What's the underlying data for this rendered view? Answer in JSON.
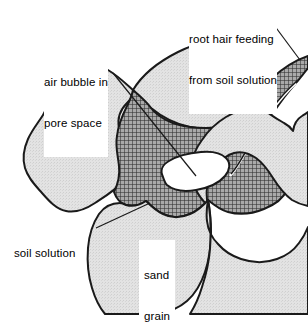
{
  "figure": {
    "background_color": "#ffffff",
    "width": 308,
    "height": 315
  },
  "colors": {
    "outline": "#1a1a1a",
    "sand_grain_fill": "#e2e2e2",
    "sand_grain_speckle": "#c9c9c9",
    "soil_solution_fill": "#8d8d8d",
    "soil_solution_hatch": "#2b2b2b",
    "air_bubble_fill": "#ffffff",
    "label_text": "#000000",
    "leader_line": "#1a1a1a"
  },
  "labels": {
    "root_hair": {
      "line1": "root hair feeding",
      "line2": "from soil solution"
    },
    "air_bubble": {
      "line1": "air bubble in",
      "line2": "pore space"
    },
    "soil_solution": {
      "line1": "soil solution"
    },
    "sand_grain": {
      "line1": "sand",
      "line2": "grain"
    }
  },
  "regions": [
    {
      "name": "sand-grain-left",
      "type": "sand grain",
      "fill": "#e2e2e2"
    },
    {
      "name": "sand-grain-top",
      "type": "sand grain",
      "fill": "#e2e2e2"
    },
    {
      "name": "sand-grain-right",
      "type": "sand grain",
      "fill": "#e2e2e2"
    },
    {
      "name": "sand-grain-bottom-left",
      "type": "sand grain",
      "fill": "#e2e2e2"
    },
    {
      "name": "sand-grain-bottom-right",
      "type": "sand grain",
      "fill": "#e2e2e2"
    },
    {
      "name": "soil-solution",
      "type": "soil solution",
      "fill": "#8d8d8d"
    },
    {
      "name": "root-hair",
      "type": "root hair",
      "fill": "#8d8d8d"
    },
    {
      "name": "air-bubble",
      "type": "air bubble",
      "fill": "#ffffff"
    }
  ]
}
